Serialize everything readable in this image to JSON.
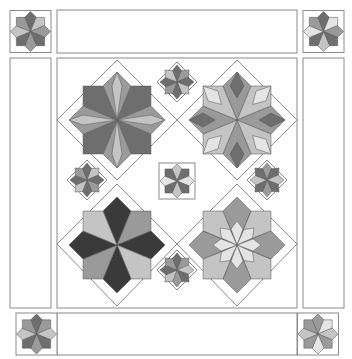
{
  "diagram": {
    "colors": {
      "outline": "#8a8a8a",
      "dark": "#3a3a3a",
      "mid_dark": "#6e6e6e",
      "mid": "#9a9a9a",
      "light": "#c4c4c4",
      "lightest": "#e4e4e4",
      "background": "#ffffff"
    },
    "corner_blocks": [
      {
        "position": "top-left",
        "style": "eight-point-star"
      },
      {
        "position": "top-right",
        "style": "eight-point-star"
      },
      {
        "position": "bottom-left",
        "style": "eight-point-star"
      },
      {
        "position": "bottom-right",
        "style": "eight-point-star"
      }
    ],
    "border_strips": [
      "top",
      "left",
      "right",
      "bottom"
    ],
    "center_medallion": {
      "large_stars": [
        {
          "position": "top-left",
          "style": "striped-eight-point-star"
        },
        {
          "position": "top-right",
          "style": "patchwork-eight-point-star"
        },
        {
          "position": "bottom-left",
          "style": "dark-eight-point-star"
        },
        {
          "position": "bottom-right",
          "style": "broken-star"
        }
      ],
      "small_stars": [
        "top",
        "left",
        "right",
        "bottom",
        "center"
      ]
    }
  }
}
